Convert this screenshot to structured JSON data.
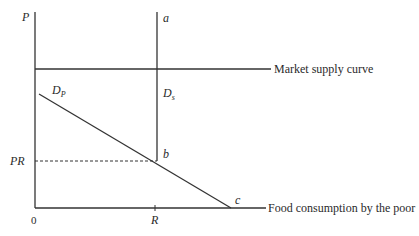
{
  "diagram": {
    "type": "economics-supply-demand",
    "axes": {
      "y_label": "P",
      "x_label": "Food consumption by the poor",
      "origin_label": "0"
    },
    "curves": {
      "market_supply_label": "Market supply curve",
      "demand_poor_label": "D",
      "demand_poor_sub": "P",
      "demand_subsidy_label": "D",
      "demand_subsidy_sub": "s"
    },
    "points": {
      "a": "a",
      "b": "b",
      "c": "c"
    },
    "ticks": {
      "price_ration": "PR",
      "ration_qty": "R"
    },
    "colors": {
      "line": "#333333",
      "background": "#ffffff"
    }
  }
}
